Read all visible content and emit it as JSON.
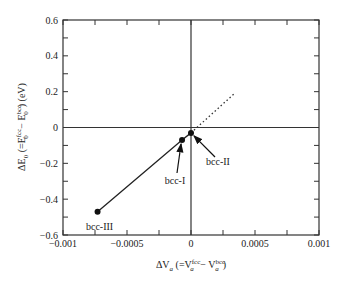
{
  "chart_data": {
    "type": "scatter",
    "title": "",
    "xlabel": "ΔV_a (=V_a^fcc − V_a^bcc)",
    "ylabel": "ΔE_0 (=E_0^fcc − E_0^bcc) (eV)",
    "xlim": [
      -0.001,
      0.001
    ],
    "ylim": [
      -0.6,
      0.6
    ],
    "xticks": [
      -0.001,
      -0.0005,
      0,
      0.0005,
      0.001
    ],
    "xtick_labels": [
      "−0.001",
      "−0.0005",
      "0",
      "0.0005",
      "0.001"
    ],
    "yticks": [
      -0.6,
      -0.4,
      -0.2,
      0,
      0.2,
      0.4,
      0.6
    ],
    "ytick_labels": [
      "−0.6",
      "−0.4",
      "−0.2",
      "0",
      "0.2",
      "0.4",
      "0.6"
    ],
    "grid": false,
    "zero_lines": true,
    "series": [
      {
        "name": "bcc structures",
        "style": "solid line with filled markers",
        "points": [
          {
            "label": "bcc-III",
            "x": -0.00073,
            "y": -0.47
          },
          {
            "label": "bcc-I",
            "x": -7e-05,
            "y": -0.07
          },
          {
            "label": "bcc-II",
            "x": 0.0,
            "y": -0.03
          }
        ]
      },
      {
        "name": "extrapolation",
        "style": "dotted line",
        "points": [
          {
            "x": 0.0,
            "y": -0.03
          },
          {
            "x": 0.00034,
            "y": 0.19
          }
        ]
      }
    ],
    "annotations": [
      {
        "text": "bcc-III",
        "points_to": "bcc-III"
      },
      {
        "text": "bcc-I",
        "points_to": "bcc-I",
        "arrow": true
      },
      {
        "text": "bcc-II",
        "points_to": "bcc-II",
        "arrow": true
      }
    ]
  },
  "labels": {
    "x_axis": {
      "prefix": "ΔV",
      "sub": "a",
      "mid": " (=V",
      "sup1": "fcc",
      "sub1": "a",
      "minus": " − V",
      "sup2": "bcc",
      "sub2": "a",
      "end": ")"
    },
    "y_axis": {
      "prefix": "ΔE",
      "sub": "0",
      "mid": " (=E",
      "sup1": "fcc",
      "sub1": "0",
      "minus": " − E",
      "sup2": "bcc",
      "sub2": "0",
      "end": ") (eV)"
    },
    "bcc1": "bcc-I",
    "bcc2": "bcc-II",
    "bcc3": "bcc-III"
  }
}
